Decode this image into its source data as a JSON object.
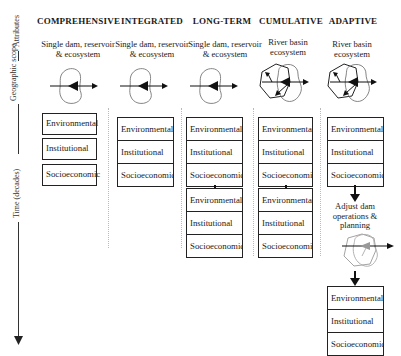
{
  "axes": {
    "attributes_label": "Attributes",
    "geographic_scope_label": "Geographic scope",
    "time_label": "Time (decades)"
  },
  "columns": [
    {
      "title": "COMPREHENSIVE",
      "scope_line1": "Single dam, reservoir",
      "scope_line2": "& ecosystem",
      "scope_icon": "single-reservoir-arrow-icon",
      "stages": [
        {
          "layout": "separate",
          "items": [
            "Environmental",
            "Institutional",
            "Socioeconomic"
          ]
        }
      ]
    },
    {
      "title": "INTEGRATED",
      "scope_line1": "Single dam, reservoir",
      "scope_line2": "& ecosystem",
      "scope_icon": "single-reservoir-arrow-icon",
      "stages": [
        {
          "layout": "combined",
          "items": [
            "Environmental",
            "Institutional",
            "Socioeconomic"
          ]
        }
      ]
    },
    {
      "title": "LONG-TERM",
      "scope_line1": "Single dam, reservoir",
      "scope_line2": "& ecosystem",
      "scope_icon": "single-reservoir-arrow-icon",
      "stages": [
        {
          "layout": "combined",
          "items": [
            "Environmental",
            "Institutional",
            "Socioeconomic"
          ]
        },
        {
          "layout": "combined",
          "items": [
            "Environmental",
            "Institutional",
            "Socioeconomic"
          ]
        }
      ]
    },
    {
      "title": "CUMULATIVE",
      "scope_line1": "River basin",
      "scope_line2": "ecosystem",
      "scope_icon": "river-basin-multi-arrow-icon",
      "stages": [
        {
          "layout": "combined",
          "items": [
            "Environmental",
            "Institutional",
            "Socioeconomic"
          ]
        },
        {
          "layout": "combined",
          "items": [
            "Environmental",
            "Institutional",
            "Socioeconomic"
          ]
        }
      ]
    },
    {
      "title": "ADAPTIVE",
      "scope_line1": "River basin",
      "scope_line2": "ecosystem",
      "scope_icon": "river-basin-multi-arrow-icon",
      "adjust_note_line1": "Adjust dam",
      "adjust_note_line2": "operations &",
      "adjust_note_line3": "planning",
      "stages": [
        {
          "layout": "combined",
          "items": [
            "Environmental",
            "Institutional",
            "Socioeconomic"
          ]
        },
        {
          "layout": "combined",
          "items": [
            "Environmental",
            "Institutional",
            "Socioeconomic"
          ]
        }
      ]
    }
  ]
}
